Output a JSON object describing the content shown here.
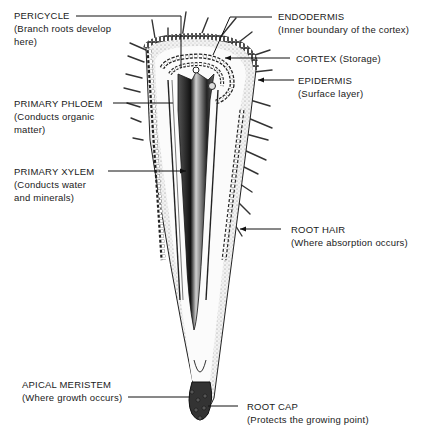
{
  "diagram": {
    "labels": [
      {
        "id": "pericycle",
        "title": "PERICYCLE",
        "desc": [
          "(Branch roots develop",
          "here)"
        ]
      },
      {
        "id": "endodermis",
        "title": "ENDODERMIS",
        "desc": [
          "(Inner boundary of the cortex)"
        ]
      },
      {
        "id": "cortex",
        "title": "CORTEX  (Storage)",
        "desc": []
      },
      {
        "id": "epidermis",
        "title": "EPIDERMIS",
        "desc": [
          "(Surface layer)"
        ]
      },
      {
        "id": "primary-phloem",
        "title": "PRIMARY PHLOEM",
        "desc": [
          "(Conducts organic",
          "matter)"
        ]
      },
      {
        "id": "primary-xylem",
        "title": "PRIMARY XYLEM",
        "desc": [
          "(Conducts water",
          "and minerals)"
        ]
      },
      {
        "id": "root-hair",
        "title": "ROOT HAIR",
        "desc": [
          "(Where absorption occurs)"
        ]
      },
      {
        "id": "apical-meristem",
        "title": "APICAL MERISTEM",
        "desc": [
          "(Where growth occurs)"
        ]
      },
      {
        "id": "root-cap",
        "title": "ROOT CAP",
        "desc": [
          "(Protects the growing point)"
        ]
      }
    ]
  }
}
